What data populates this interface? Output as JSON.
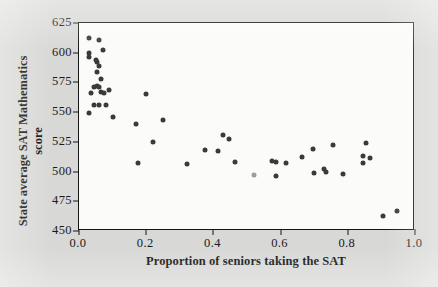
{
  "figure": {
    "background_color": "#d8d8d6",
    "plot_background_color": "#fbfbfa",
    "frame_color": "#141414"
  },
  "chart_data": {
    "type": "scatter",
    "title": "",
    "xlabel": "Proportion of seniors taking the SAT",
    "ylabel_line1": "State average SAT Mathematics",
    "ylabel_line2": "score",
    "xlim": [
      0.0,
      1.0
    ],
    "ylim": [
      450,
      625
    ],
    "xticks": [
      0.0,
      0.2,
      0.4,
      0.6,
      0.8,
      1.0
    ],
    "xtick_labels": [
      "0.0",
      "0.2",
      "0.4",
      "0.6",
      "0.8",
      "1.0"
    ],
    "yticks": [
      450,
      475,
      500,
      525,
      550,
      575,
      600,
      625
    ],
    "ytick_labels": [
      "450",
      "475",
      "500",
      "525",
      "550",
      "575",
      "600",
      "625"
    ],
    "grid": false,
    "legend": false,
    "marker_color": "#3a3a3a",
    "highlight_marker_color": "#9d9d9d",
    "points": [
      {
        "x": 0.03,
        "y": 612
      },
      {
        "x": 0.06,
        "y": 611
      },
      {
        "x": 0.03,
        "y": 600
      },
      {
        "x": 0.07,
        "y": 602
      },
      {
        "x": 0.03,
        "y": 596
      },
      {
        "x": 0.05,
        "y": 594
      },
      {
        "x": 0.055,
        "y": 592
      },
      {
        "x": 0.06,
        "y": 589
      },
      {
        "x": 0.055,
        "y": 584
      },
      {
        "x": 0.065,
        "y": 578
      },
      {
        "x": 0.045,
        "y": 571
      },
      {
        "x": 0.055,
        "y": 572
      },
      {
        "x": 0.06,
        "y": 571
      },
      {
        "x": 0.035,
        "y": 566
      },
      {
        "x": 0.065,
        "y": 567
      },
      {
        "x": 0.075,
        "y": 566
      },
      {
        "x": 0.09,
        "y": 569
      },
      {
        "x": 0.045,
        "y": 556
      },
      {
        "x": 0.06,
        "y": 556
      },
      {
        "x": 0.08,
        "y": 556
      },
      {
        "x": 0.03,
        "y": 549
      },
      {
        "x": 0.1,
        "y": 546
      },
      {
        "x": 0.17,
        "y": 540
      },
      {
        "x": 0.2,
        "y": 565
      },
      {
        "x": 0.22,
        "y": 525
      },
      {
        "x": 0.25,
        "y": 543
      },
      {
        "x": 0.175,
        "y": 507
      },
      {
        "x": 0.32,
        "y": 506
      },
      {
        "x": 0.375,
        "y": 518
      },
      {
        "x": 0.415,
        "y": 517
      },
      {
        "x": 0.43,
        "y": 531
      },
      {
        "x": 0.445,
        "y": 527
      },
      {
        "x": 0.465,
        "y": 508
      },
      {
        "x": 0.52,
        "y": 497
      },
      {
        "x": 0.575,
        "y": 509
      },
      {
        "x": 0.585,
        "y": 508
      },
      {
        "x": 0.585,
        "y": 496
      },
      {
        "x": 0.615,
        "y": 507
      },
      {
        "x": 0.665,
        "y": 512
      },
      {
        "x": 0.695,
        "y": 519
      },
      {
        "x": 0.7,
        "y": 499
      },
      {
        "x": 0.73,
        "y": 502
      },
      {
        "x": 0.735,
        "y": 500
      },
      {
        "x": 0.755,
        "y": 522
      },
      {
        "x": 0.785,
        "y": 498
      },
      {
        "x": 0.845,
        "y": 513
      },
      {
        "x": 0.845,
        "y": 507
      },
      {
        "x": 0.855,
        "y": 524
      },
      {
        "x": 0.865,
        "y": 511
      },
      {
        "x": 0.905,
        "y": 463,
        "highlight": false
      },
      {
        "x": 0.945,
        "y": 467
      }
    ],
    "highlight_point": {
      "x": 0.52,
      "y": 497
    }
  }
}
